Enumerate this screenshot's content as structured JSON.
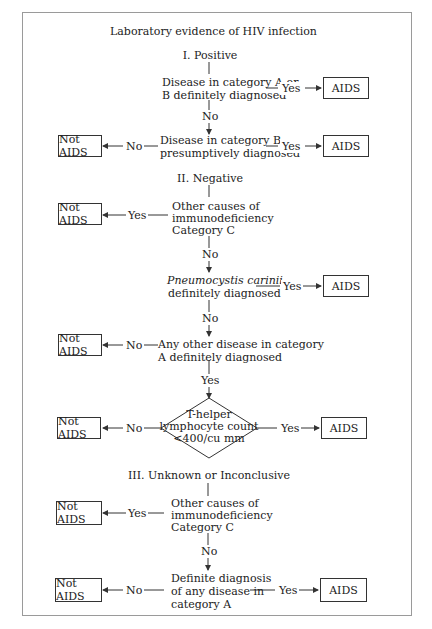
{
  "diagram": {
    "title": "Laboratory evidence of HIV infection",
    "sections": [
      {
        "heading": "I. Positive",
        "nodes": [
          {
            "id": "p1",
            "text_lines": [
              "Disease in category A or",
              "B definitely diagnosed"
            ],
            "yes": "AIDS",
            "no": "p2"
          },
          {
            "id": "p2",
            "text_lines": [
              "Disease in category B",
              "presumptively diagnosed"
            ],
            "yes": "AIDS",
            "no": "Not AIDS"
          }
        ]
      },
      {
        "heading": "II. Negative",
        "nodes": [
          {
            "id": "n1",
            "text_lines": [
              "Other causes of",
              "immunodeficiency",
              "Category C"
            ],
            "yes": "Not AIDS",
            "no": "n2"
          },
          {
            "id": "n2",
            "text_lines": [
              "Pneumocystis carinii",
              "definitely diagnosed"
            ],
            "italic_first_line": true,
            "yes": "AIDS",
            "no": "n3"
          },
          {
            "id": "n3",
            "text_lines": [
              "Any other disease in category",
              "A definitely diagnosed"
            ],
            "yes": "n4",
            "no": "Not AIDS"
          },
          {
            "id": "n4",
            "shape": "diamond",
            "text_lines": [
              "T-helper",
              "lymphocyte count",
              "<400/cu mm"
            ],
            "yes": "AIDS",
            "no": "Not AIDS"
          }
        ]
      },
      {
        "heading": "III. Unknown or Inconclusive",
        "nodes": [
          {
            "id": "u1",
            "text_lines": [
              "Other causes of",
              "immunodeficiency",
              "Category C"
            ],
            "yes": "Not AIDS",
            "no": "u2"
          },
          {
            "id": "u2",
            "text_lines": [
              "Definite diagnosis",
              "of any disease in",
              "category A"
            ],
            "yes": "AIDS",
            "no": "Not AIDS"
          }
        ]
      }
    ],
    "labels": {
      "yes": "Yes",
      "no": "No",
      "aids": "AIDS",
      "not_aids": "Not AIDS"
    },
    "colors": {
      "line": "#333333",
      "frame": "#9a9a9a",
      "background": "#ffffff"
    }
  }
}
